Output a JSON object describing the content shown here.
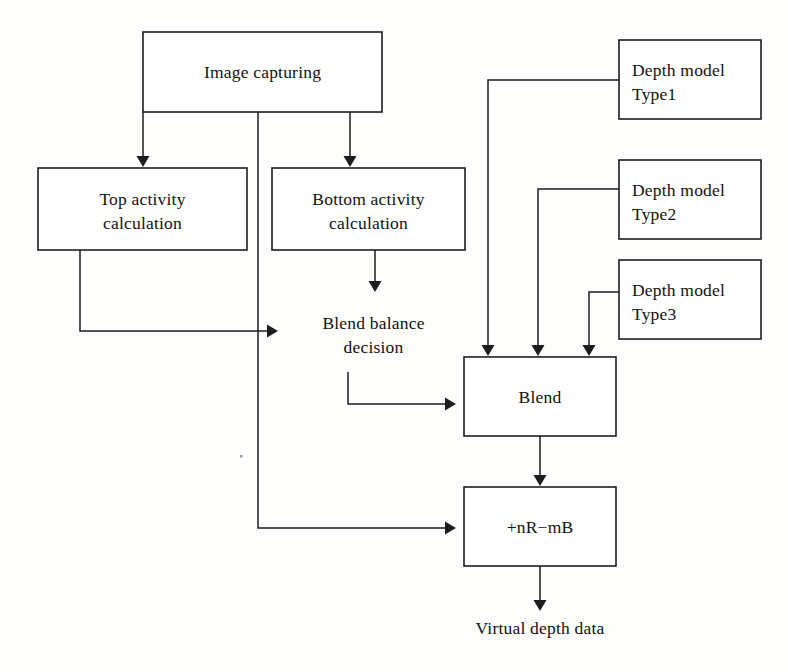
{
  "diagram": {
    "type": "flowchart",
    "background_color": "#fdfdfc",
    "line_color": "#1d1d1d",
    "text_color": "#121212",
    "nodes": [
      {
        "id": "image_capturing",
        "label_line1": "Image capturing",
        "label_line2": "",
        "align": "center",
        "x": 143,
        "y": 32,
        "w": 239,
        "h": 80
      },
      {
        "id": "top_activity",
        "label_line1": "Top activity",
        "label_line2": "calculation",
        "align": "center",
        "x": 38,
        "y": 168,
        "w": 209,
        "h": 82
      },
      {
        "id": "bottom_activity",
        "label_line1": "Bottom activity",
        "label_line2": "calculation",
        "align": "center",
        "x": 272,
        "y": 168,
        "w": 193,
        "h": 82
      },
      {
        "id": "blend_balance",
        "label_line1": "Blend balance",
        "label_line2": "decision",
        "align": "center",
        "x": 286,
        "y": 293,
        "w": 175,
        "h": 79
      },
      {
        "id": "blend",
        "label_line1": "Blend",
        "label_line2": "",
        "align": "center",
        "x": 464,
        "y": 357,
        "w": 152,
        "h": 79
      },
      {
        "id": "nr_mb",
        "label_line1": "+nR−mB",
        "label_line2": "",
        "align": "center",
        "x": 464,
        "y": 487,
        "w": 152,
        "h": 79
      },
      {
        "id": "depth_model_type1",
        "label_line1": "Depth model",
        "label_line2": "Type1",
        "align": "left",
        "x": 619,
        "y": 40,
        "w": 142,
        "h": 79
      },
      {
        "id": "depth_model_type2",
        "label_line1": "Depth model",
        "label_line2": "Type2",
        "align": "left",
        "x": 619,
        "y": 160,
        "w": 142,
        "h": 79
      },
      {
        "id": "depth_model_type3",
        "label_line1": "Depth model",
        "label_line2": "Type3",
        "align": "left",
        "x": 619,
        "y": 260,
        "w": 142,
        "h": 79
      }
    ],
    "free_labels": [
      {
        "id": "virtual_depth_data",
        "text": "Virtual depth data",
        "x": 540,
        "y": 634
      }
    ],
    "edges": [
      {
        "id": "capture-to-top",
        "from": "image_capturing",
        "to": "top_activity",
        "path": "M 143 112 L 143 160",
        "arrow_x": 143,
        "arrow_y": 167,
        "dir": "down"
      },
      {
        "id": "capture-to-bottom",
        "from": "image_capturing",
        "to": "bottom_activity",
        "path": "M 350 112 L 350 160",
        "arrow_x": 350,
        "arrow_y": 167,
        "dir": "down"
      },
      {
        "id": "capture-to-nrmb",
        "from": "image_capturing",
        "to": "nr_mb",
        "path": "M 258 112 L 258 528 L 449 528",
        "arrow_x": 456,
        "arrow_y": 528,
        "dir": "right"
      },
      {
        "id": "top-to-blendbalance",
        "from": "top_activity",
        "to": "blend_balance",
        "path": "M 80 250 L 80 331 L 271 331",
        "arrow_x": 278,
        "arrow_y": 331,
        "dir": "right"
      },
      {
        "id": "bottom-to-blendbalance",
        "from": "bottom_activity",
        "to": "blend_balance",
        "path": "M 375 250 L 375 286",
        "arrow_x": 375,
        "arrow_y": 292,
        "dir": "down"
      },
      {
        "id": "blendbalance-to-blend",
        "from": "blend_balance",
        "to": "blend",
        "path": "M 348 372 L 348 404 L 449 404",
        "arrow_x": 456,
        "arrow_y": 404,
        "dir": "right"
      },
      {
        "id": "type1-to-blend",
        "from": "depth_model_type1",
        "to": "blend",
        "path": "M 619 80 L 488 80 L 488 350",
        "arrow_x": 488,
        "arrow_y": 356,
        "dir": "down"
      },
      {
        "id": "type2-to-blend",
        "from": "depth_model_type2",
        "to": "blend",
        "path": "M 619 189 L 538 189 L 538 350",
        "arrow_x": 538,
        "arrow_y": 356,
        "dir": "down"
      },
      {
        "id": "type3-to-blend",
        "from": "depth_model_type3",
        "to": "blend",
        "path": "M 619 292 L 589 292 L 589 350",
        "arrow_x": 589,
        "arrow_y": 356,
        "dir": "down"
      },
      {
        "id": "blend-to-nrmb",
        "from": "blend",
        "to": "nr_mb",
        "path": "M 540 436 L 540 480",
        "arrow_x": 540,
        "arrow_y": 486,
        "dir": "down"
      },
      {
        "id": "nrmb-to-output",
        "from": "nr_mb",
        "to": "virtual_depth_data",
        "path": "M 540 566 L 540 605",
        "arrow_x": 540,
        "arrow_y": 611,
        "dir": "down"
      }
    ]
  }
}
